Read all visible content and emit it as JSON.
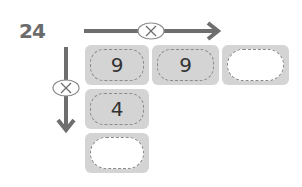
{
  "problem": {
    "number": "24"
  },
  "operators": {
    "horizontal": "×",
    "vertical": "×"
  },
  "grid": {
    "row1": [
      "9",
      "9",
      ""
    ],
    "row2": [
      "4"
    ],
    "row3": [
      ""
    ]
  },
  "colors": {
    "arrow": "#6e6e6e",
    "box": "#d4d4d4",
    "dash": "#8a8a8a"
  }
}
